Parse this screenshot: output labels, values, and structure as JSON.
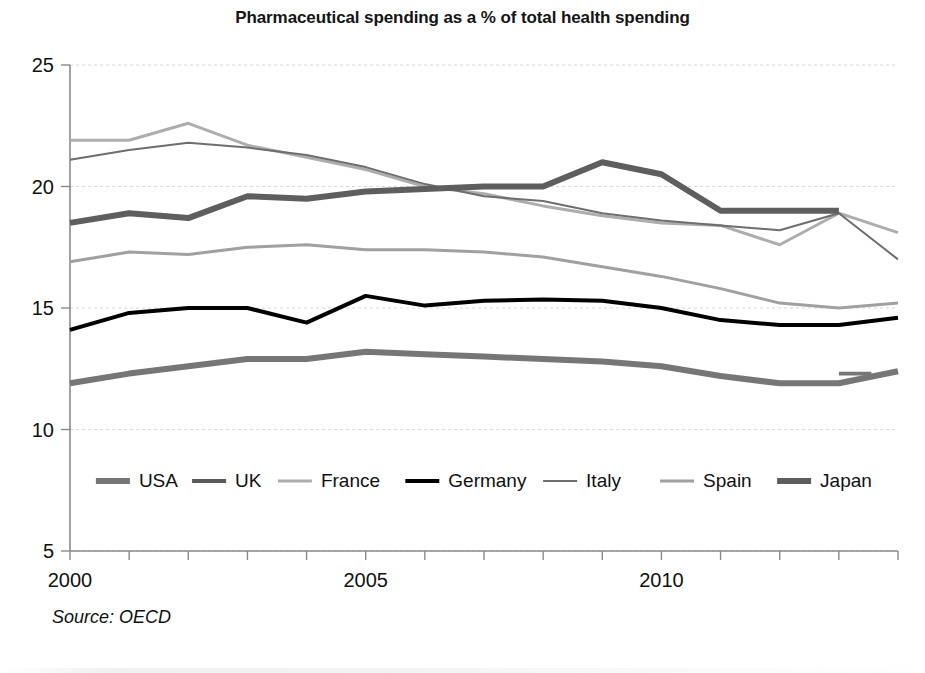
{
  "chart_data": {
    "type": "line",
    "title": "Pharmaceutical spending as a % of total health spending",
    "subtitle": "",
    "xlabel": "",
    "ylabel": "",
    "source": "Source: OECD",
    "grid": true,
    "legend_position": "inside-bottom",
    "xlim": [
      2000,
      2014
    ],
    "ylim": [
      5,
      25
    ],
    "yticks": [
      5,
      10,
      15,
      20,
      25
    ],
    "ytick_labels": [
      "5",
      "10",
      "15",
      "20",
      "25"
    ],
    "xticks": [
      2000,
      2001,
      2002,
      2003,
      2004,
      2005,
      2006,
      2007,
      2008,
      2009,
      2010,
      2011,
      2012,
      2013,
      2014
    ],
    "xtick_labels_shown": [
      "2000",
      "2005",
      "2010"
    ],
    "x": [
      2000,
      2001,
      2002,
      2003,
      2004,
      2005,
      2006,
      2007,
      2008,
      2009,
      2010,
      2011,
      2012,
      2013,
      2014
    ],
    "series": [
      {
        "name": "USA",
        "color": "#767676",
        "width": 6,
        "values": [
          11.9,
          12.3,
          12.6,
          12.9,
          12.9,
          13.2,
          13.1,
          13.0,
          12.9,
          12.8,
          12.6,
          12.2,
          11.9,
          11.9,
          12.4
        ],
        "break_at": 2013,
        "break_value": 12.3
      },
      {
        "name": "UK",
        "color": "#595959",
        "width": 4,
        "values": [
          null,
          null,
          null,
          null,
          null,
          null,
          null,
          null,
          null,
          null,
          null,
          null,
          null,
          null,
          null
        ]
      },
      {
        "name": "France",
        "color": "#adadad",
        "width": 3,
        "values": [
          21.9,
          21.9,
          22.6,
          21.7,
          21.2,
          20.7,
          20.0,
          19.7,
          19.2,
          18.8,
          18.5,
          18.4,
          17.6,
          18.9,
          18.1
        ]
      },
      {
        "name": "Germany",
        "color": "#000000",
        "width": 4,
        "values": [
          14.1,
          14.8,
          15.0,
          15.0,
          14.4,
          15.5,
          15.1,
          15.3,
          15.35,
          15.3,
          15.0,
          14.5,
          14.3,
          14.3,
          14.6
        ]
      },
      {
        "name": "Italy",
        "color": "#6e6e6e",
        "width": 2,
        "values": [
          21.1,
          21.5,
          21.8,
          21.6,
          21.3,
          20.8,
          20.1,
          19.6,
          19.4,
          18.9,
          18.6,
          18.4,
          18.2,
          18.9,
          17.0
        ]
      },
      {
        "name": "Spain",
        "color": "#a0a0a0",
        "width": 3,
        "values": [
          16.9,
          17.3,
          17.2,
          17.5,
          17.6,
          17.4,
          17.4,
          17.3,
          17.1,
          16.7,
          16.3,
          15.8,
          15.2,
          15.0,
          15.2
        ]
      },
      {
        "name": "Japan",
        "color": "#5e5e5e",
        "width": 6,
        "values": [
          18.5,
          18.9,
          18.7,
          19.6,
          19.5,
          19.8,
          19.9,
          20.0,
          20.0,
          21.0,
          20.5,
          19.0,
          19.0,
          19.0,
          null
        ]
      }
    ],
    "legend": [
      {
        "label": "USA",
        "color": "#767676",
        "width": 6
      },
      {
        "label": "UK",
        "color": "#595959",
        "width": 4
      },
      {
        "label": "France",
        "color": "#adadad",
        "width": 3
      },
      {
        "label": "Germany",
        "color": "#000000",
        "width": 4
      },
      {
        "label": "Italy",
        "color": "#6e6e6e",
        "width": 2
      },
      {
        "label": "Spain",
        "color": "#a0a0a0",
        "width": 3
      },
      {
        "label": "Japan",
        "color": "#5e5e5e",
        "width": 6
      }
    ]
  },
  "axis": {
    "color": "#8a8a8a",
    "grid_color": "#d8d8d8"
  }
}
